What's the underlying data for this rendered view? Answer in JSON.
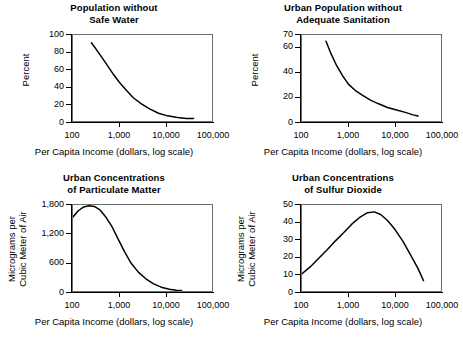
{
  "figure": {
    "name": "environmental-indicators-vs-income-panels",
    "panel_count": 4
  },
  "common": {
    "xlabel": "Per Capita Income (dollars, log scale)",
    "xticks": [
      "100",
      "1,000",
      "10,000",
      "100,000"
    ]
  },
  "chart_data": [
    {
      "type": "line",
      "panel": 0,
      "title_line1": "Population without",
      "title_line2": "Safe Water",
      "xlabel": "Per Capita Income (dollars, log scale)",
      "ylabel_line1": "Percent",
      "ylabel_line2": "",
      "xscale": "log",
      "xlim": [
        100,
        100000
      ],
      "ylim": [
        0,
        100
      ],
      "xticks": [
        100,
        1000,
        10000,
        100000
      ],
      "xticklabels": [
        "100",
        "1,000",
        "10,000",
        "100,000"
      ],
      "yticks": [
        0,
        20,
        40,
        60,
        80,
        100
      ],
      "yticklabels": [
        "0",
        "20",
        "40",
        "60",
        "80",
        "100"
      ],
      "grid": false,
      "legend": "none",
      "series": [
        {
          "name": "Population without safe water",
          "x": [
            250,
            320,
            420,
            560,
            750,
            1000,
            1400,
            2000,
            3000,
            4500,
            7000,
            11000,
            18000,
            28000,
            40000
          ],
          "y": [
            91,
            83,
            74,
            64,
            54,
            45,
            36,
            27,
            20,
            14,
            9,
            6,
            4,
            3,
            3
          ]
        }
      ]
    },
    {
      "type": "line",
      "panel": 1,
      "title_line1": "Urban Population without",
      "title_line2": "Adequate Sanitation",
      "xlabel": "Per Capita Income (dollars, log scale)",
      "ylabel_line1": "Percent",
      "ylabel_line2": "",
      "xscale": "log",
      "xlim": [
        100,
        100000
      ],
      "ylim": [
        0,
        70
      ],
      "xticks": [
        100,
        1000,
        10000,
        100000
      ],
      "xticklabels": [
        "100",
        "1,000",
        "10,000",
        "100,000"
      ],
      "yticks": [
        0,
        20,
        40,
        60,
        70
      ],
      "yticklabels": [
        "0",
        "20",
        "40",
        "60",
        "70"
      ],
      "grid": false,
      "legend": "none",
      "series": [
        {
          "name": "Urban population without adequate sanitation",
          "x": [
            330,
            420,
            560,
            750,
            1000,
            1400,
            2000,
            3000,
            4500,
            7000,
            11000,
            17000,
            25000,
            32000
          ],
          "y": [
            65,
            55,
            45,
            37,
            30,
            25,
            21,
            17,
            14,
            11,
            9,
            7,
            5,
            4
          ]
        }
      ]
    },
    {
      "type": "line",
      "panel": 2,
      "title_line1": "Urban Concentrations",
      "title_line2": "of Particulate Matter",
      "xlabel": "Per Capita Income (dollars, log scale)",
      "ylabel_line1": "Micrograms per",
      "ylabel_line2": "Cubic Meter of Air",
      "xscale": "log",
      "xlim": [
        100,
        100000
      ],
      "ylim": [
        0,
        1800
      ],
      "xticks": [
        100,
        1000,
        10000,
        100000
      ],
      "xticklabels": [
        "100",
        "1,000",
        "10,000",
        "100,000"
      ],
      "yticks": [
        0,
        600,
        1200,
        1800
      ],
      "yticklabels": [
        "0",
        "600",
        "1,200",
        "1,800"
      ],
      "grid": false,
      "legend": "none",
      "series": [
        {
          "name": "Urban concentrations of particulate matter",
          "x": [
            100,
            130,
            170,
            220,
            290,
            380,
            500,
            700,
            950,
            1300,
            1800,
            2600,
            3800,
            5500,
            8000,
            12000,
            17000,
            22000
          ],
          "y": [
            1550,
            1680,
            1760,
            1785,
            1770,
            1700,
            1560,
            1340,
            1080,
            820,
            580,
            390,
            250,
            150,
            80,
            35,
            15,
            10
          ]
        }
      ]
    },
    {
      "type": "line",
      "panel": 3,
      "title_line1": "Urban Concentrations",
      "title_line2": "of Sulfur Dioxide",
      "xlabel": "Per Capita Income (dollars, log scale)",
      "ylabel_line1": "Micrograms per",
      "ylabel_line2": "Cubic Meter of Air",
      "xscale": "log",
      "xlim": [
        100,
        100000
      ],
      "ylim": [
        0,
        50
      ],
      "xticks": [
        100,
        1000,
        10000,
        100000
      ],
      "xticklabels": [
        "100",
        "1,000",
        "10,000",
        "100,000"
      ],
      "yticks": [
        0,
        10,
        20,
        30,
        40,
        50
      ],
      "yticklabels": [
        "0",
        "10",
        "20",
        "30",
        "40",
        "50"
      ],
      "grid": false,
      "legend": "none",
      "series": [
        {
          "name": "Urban concentrations of sulfur dioxide",
          "x": [
            100,
            150,
            230,
            350,
            520,
            800,
            1200,
            1800,
            2600,
            3600,
            5000,
            7000,
            10000,
            15000,
            22000,
            32000,
            42000
          ],
          "y": [
            10,
            14,
            19,
            24,
            29,
            34,
            39,
            43,
            45.5,
            46,
            44.5,
            41,
            36,
            29,
            21,
            13,
            6
          ]
        }
      ]
    }
  ],
  "colors": {
    "curve": "#000000",
    "axis": "#000000",
    "plot_border": "#6e6e6e",
    "background": "#ffffff",
    "text": "#000000"
  }
}
